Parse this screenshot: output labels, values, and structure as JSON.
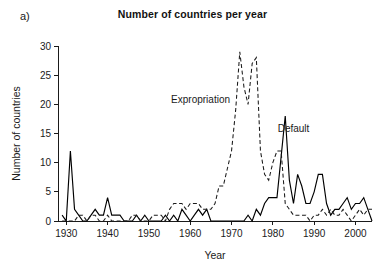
{
  "panel": {
    "label": "a)"
  },
  "chart_data": {
    "type": "line",
    "title": "Number of countries per year",
    "xlabel": "Year",
    "ylabel": "Number of countries",
    "xlim": [
      1928,
      2004
    ],
    "ylim": [
      0,
      31
    ],
    "xticks": [
      1930,
      1940,
      1950,
      1960,
      1970,
      1980,
      1990,
      2000
    ],
    "yticks": [
      0,
      5,
      10,
      15,
      20,
      25,
      30
    ],
    "grid": false,
    "legend_position": "inline-annotations",
    "annotations": [
      {
        "text": "Expropriation",
        "x": 1962.5,
        "y": 20.2
      },
      {
        "text": "Default",
        "x": 1985.0,
        "y": 15.2
      }
    ],
    "x": [
      1929,
      1930,
      1931,
      1932,
      1933,
      1934,
      1935,
      1936,
      1937,
      1938,
      1939,
      1940,
      1941,
      1942,
      1943,
      1944,
      1945,
      1946,
      1947,
      1948,
      1949,
      1950,
      1951,
      1952,
      1953,
      1954,
      1955,
      1956,
      1957,
      1958,
      1959,
      1960,
      1961,
      1962,
      1963,
      1964,
      1965,
      1966,
      1967,
      1968,
      1969,
      1970,
      1971,
      1972,
      1973,
      1974,
      1975,
      1976,
      1977,
      1978,
      1979,
      1980,
      1981,
      1982,
      1983,
      1984,
      1985,
      1986,
      1987,
      1988,
      1989,
      1990,
      1991,
      1992,
      1993,
      1994,
      1995,
      1996,
      1997,
      1998,
      1999,
      2000,
      2001,
      2002,
      2003,
      2004
    ],
    "series": [
      {
        "name": "Default",
        "style": "solid",
        "values": [
          1,
          0,
          12,
          2,
          1,
          0,
          0,
          1,
          2,
          1,
          1,
          4,
          1,
          1,
          1,
          0,
          0,
          0,
          1,
          0,
          1,
          0,
          0,
          0,
          0,
          1,
          0,
          1,
          0,
          2,
          1,
          0,
          1,
          2,
          1,
          2,
          0,
          0,
          0,
          0,
          0,
          0,
          0,
          0,
          0,
          1,
          0,
          2,
          1,
          3,
          4,
          4,
          4,
          11,
          18,
          7,
          3,
          8,
          6,
          3,
          3,
          5,
          8,
          8,
          3,
          1,
          2,
          2,
          3,
          4,
          2,
          3,
          3,
          4,
          2,
          0
        ]
      },
      {
        "name": "Expropriation",
        "style": "dashed",
        "values": [
          0,
          0,
          0,
          0,
          1,
          1,
          0,
          1,
          1,
          0,
          0,
          1,
          0,
          0,
          0,
          0,
          0,
          1,
          1,
          0,
          0,
          0,
          1,
          1,
          1,
          0,
          2,
          3,
          3,
          3,
          2,
          3,
          3,
          3,
          2,
          2,
          2,
          3,
          6,
          6,
          9,
          12,
          19,
          29,
          23,
          20,
          27,
          28,
          12,
          8,
          7,
          10,
          12,
          12,
          3,
          2,
          1,
          1,
          1,
          1,
          0,
          1,
          1,
          2,
          1,
          2,
          1,
          1,
          2,
          1,
          0,
          1,
          2,
          1,
          2,
          2
        ]
      }
    ]
  }
}
